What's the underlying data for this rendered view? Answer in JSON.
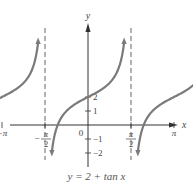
{
  "chart_data": {
    "type": "line",
    "title": "y = 2 + tan x",
    "function": "y = 2 + tan x",
    "xlabel": "x",
    "ylabel": "y",
    "x_range": [
      -4.9,
      5.5
    ],
    "y_range": [
      -3.2,
      6.0
    ],
    "x_ticks": [
      {
        "value": -4.71238898,
        "label_num": "3π",
        "label_den": "2",
        "sign": "−"
      },
      {
        "value": -3.14159265,
        "label": "−π"
      },
      {
        "value": -1.57079633,
        "label_num": "π",
        "label_den": "2",
        "sign": "−"
      },
      {
        "value": 1.57079633,
        "label_num": "π",
        "label_den": "2",
        "sign": ""
      },
      {
        "value": 3.14159265,
        "label": "π"
      },
      {
        "value": 4.71238898,
        "label_num": "3π",
        "label_den": "2",
        "sign": ""
      }
    ],
    "y_ticks": [
      {
        "value": 2,
        "label": "2"
      },
      {
        "value": 1,
        "label": "1"
      },
      {
        "value": -1,
        "label": "−1"
      },
      {
        "value": -2,
        "label": "−2"
      }
    ],
    "origin_label": "0",
    "asymptotes": [
      -4.71238898,
      -1.57079633,
      1.57079633,
      4.71238898
    ],
    "asymptote_style": "dashed",
    "branches": [
      {
        "center": -3.14159265,
        "y_at_center": 2
      },
      {
        "center": 0,
        "y_at_center": 2
      },
      {
        "center": 3.14159265,
        "y_at_center": 2
      }
    ],
    "grid": false,
    "colors": {
      "curve": "#7a7a7a",
      "axes": "#333333",
      "asymptote": "#555555",
      "text": "#444444"
    }
  },
  "caption": "y = 2 + tan x"
}
